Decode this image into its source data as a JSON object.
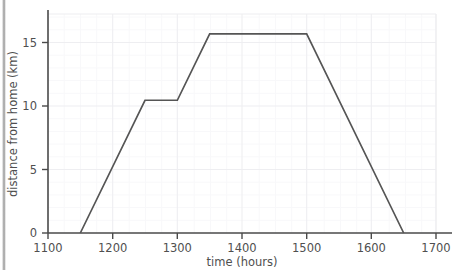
{
  "figure": {
    "background_color": "#ffffff",
    "axis_color": "#4a4a4a",
    "grid_color": "#f0f0f2",
    "grid_minor_color": "#f7f7f9",
    "line_color": "#555555",
    "tick_label_color": "#4f4f4f",
    "left_rail_color": "#9d9d9d"
  },
  "chart_data": {
    "type": "line",
    "title": "",
    "xlabel": "time (hours)",
    "ylabel": "distance from home (km)",
    "xlim": [
      1100,
      1700
    ],
    "ylim": [
      0,
      16.5
    ],
    "xticks": [
      1100,
      1200,
      1300,
      1400,
      1500,
      1600,
      1700
    ],
    "xtick_labels": [
      "1100",
      "1200",
      "1300",
      "1400",
      "1500",
      "1600",
      "1700"
    ],
    "yticks": [
      0,
      5,
      10,
      15
    ],
    "ytick_labels": [
      "0",
      "5",
      "10",
      "15"
    ],
    "x_minor_step": 25,
    "y_minor_step": 1,
    "grid": true,
    "legend": null,
    "series": [
      {
        "name": "distance from home",
        "x": [
          1150,
          1250,
          1300,
          1350,
          1500,
          1650
        ],
        "y": [
          0,
          10,
          10,
          15,
          15,
          0
        ]
      }
    ],
    "annotations": []
  },
  "labels": {
    "x_axis_title": "time (hours)",
    "y_axis_title": "distance from home (km)",
    "x_tick_1100": "1100",
    "x_tick_1200": "1200",
    "x_tick_1300": "1300",
    "x_tick_1400": "1400",
    "x_tick_1500": "1500",
    "x_tick_1600": "1600",
    "x_tick_1700": "1700",
    "y_tick_0": "0",
    "y_tick_5": "5",
    "y_tick_10": "10",
    "y_tick_15": "15"
  }
}
